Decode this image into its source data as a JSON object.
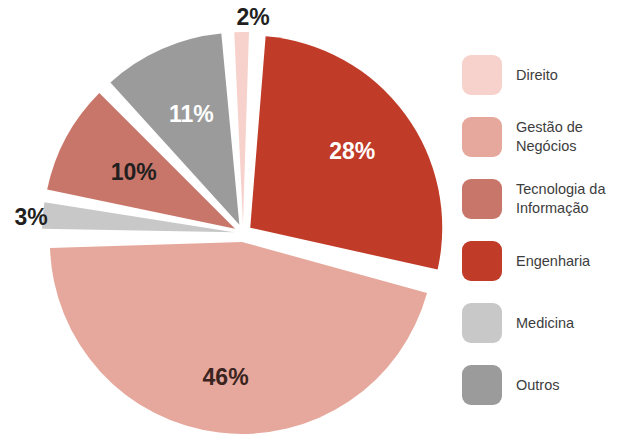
{
  "chart_data": {
    "type": "pie",
    "title": "",
    "subtitle": "",
    "xlabel": "",
    "ylabel": "",
    "legend_position": "right",
    "grid": false,
    "value_unit": "%",
    "start_angle_deg": -4,
    "categories": [
      "Direito",
      "Gestão de Negócios",
      "Tecnologia da Informação",
      "Engenharia",
      "Medicina",
      "Outros"
    ],
    "values": [
      2,
      46,
      10,
      28,
      3,
      11
    ],
    "colors": [
      "#f7d2cc",
      "#e6a89c",
      "#c9766a",
      "#c03b28",
      "#c8c8c8",
      "#9b9b9b"
    ],
    "slices": [
      {
        "label": "Direito",
        "value": 2,
        "display": "2%",
        "color": "#f7d2cc",
        "label_color": "#231f1f",
        "label_outside": true,
        "order": 1
      },
      {
        "label": "Engenharia",
        "value": 28,
        "display": "28%",
        "color": "#c03b28",
        "label_color": "#ffffff",
        "label_outside": false,
        "order": 2
      },
      {
        "label": "Gestão de Negócios",
        "value": 46,
        "display": "46%",
        "color": "#e6a89c",
        "label_color": "#3b2420",
        "label_outside": false,
        "order": 3
      },
      {
        "label": "Medicina",
        "value": 3,
        "display": "3%",
        "color": "#c8c8c8",
        "label_color": "#231f1f",
        "label_outside": true,
        "order": 4
      },
      {
        "label": "Tecnologia da Informação",
        "value": 10,
        "display": "10%",
        "color": "#c9766a",
        "label_color": "#231f1f",
        "label_outside": false,
        "order": 5
      },
      {
        "label": "Outros",
        "value": 11,
        "display": "11%",
        "color": "#9b9b9b",
        "label_color": "#ffffff",
        "label_outside": false,
        "order": 6
      }
    ]
  },
  "legend": {
    "items": [
      {
        "label": "Direito",
        "color": "#f7d2cc"
      },
      {
        "label": "Gestão de\nNegócios",
        "color": "#e6a89c"
      },
      {
        "label": "Tecnologia da\nInformação",
        "color": "#c9766a"
      },
      {
        "label": "Engenharia",
        "color": "#c03b28"
      },
      {
        "label": "Medicina",
        "color": "#c8c8c8"
      },
      {
        "label": "Outros",
        "color": "#9b9b9b"
      }
    ]
  }
}
